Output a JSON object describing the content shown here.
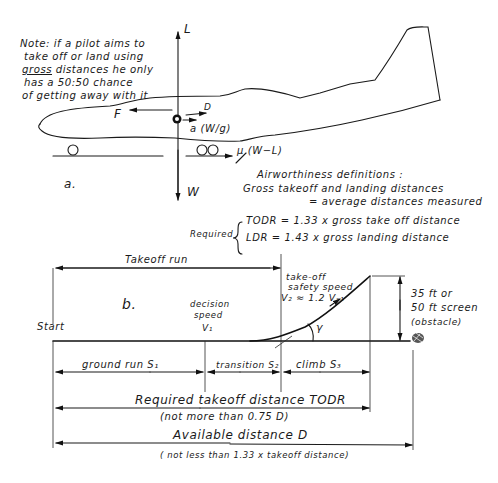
{
  "note": {
    "line1": "Note: if a pilot aims to",
    "line2": "take off or land using",
    "line3_underlined": "gross",
    "line3_rest": " distances he only",
    "line4": "has a 50:50 chance",
    "line5": "of getting away with it"
  },
  "part_a": {
    "label": "a.",
    "forces": {
      "lift": "L",
      "weight": "W",
      "thrust": "F",
      "drag": "D",
      "acceleration": "a (W/g)",
      "friction": "μ (W−L)"
    }
  },
  "definitions": {
    "heading": "Airworthiness definitions :",
    "gross_line1": "Gross takeoff and landing distances",
    "gross_line2": "= average distances measured",
    "required_label": "Required",
    "todr": "TODR = 1.33 x gross take off distance",
    "ldr": "LDR  = 1.43 x gross landing distance"
  },
  "part_b": {
    "label": "b.",
    "takeoff_run": "Takeoff run",
    "start": "Start",
    "decision_speed_line1": "decision",
    "decision_speed_line2": "speed",
    "v1": "V₁",
    "safety_speed_line1": "take-off",
    "safety_speed_line2": "safety speed",
    "v2": "V₂ ≈ 1.2 Vₛ₁",
    "climb_angle": "γ",
    "obstacle_line1": "35 ft or",
    "obstacle_line2": "50 ft screen",
    "obstacle_line3": "(obstacle)",
    "ground_run": "ground run  S₁",
    "transition": "transition S₂",
    "climb": "climb  S₃",
    "todr_label": "Required takeoff distance  TODR",
    "todr_sub": "(not more than 0.75 D)",
    "available_label": "Available distance D",
    "available_sub": "( not less than 1.33 x takeoff distance)"
  }
}
